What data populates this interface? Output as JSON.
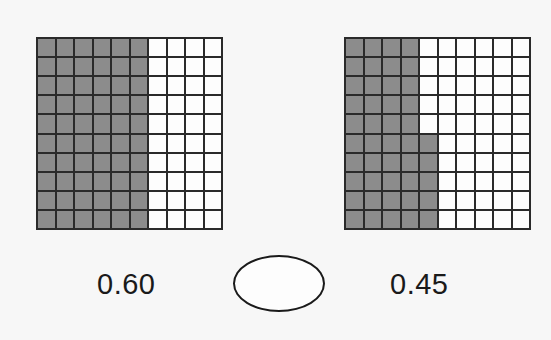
{
  "left_grid": {
    "rows": 10,
    "cols": 10,
    "shaded_full_columns": 6,
    "partial_column_shaded_bottom_rows": 0,
    "value_label": "0.60"
  },
  "right_grid": {
    "rows": 10,
    "cols": 10,
    "shaded_full_columns": 4,
    "partial_column_shaded_bottom_rows": 5,
    "value_label": "0.45"
  },
  "comparison_blank": "",
  "colors": {
    "shaded": "#8c8c8c",
    "unshaded": "#fdfdfd",
    "lines": "#2a2a2a"
  }
}
